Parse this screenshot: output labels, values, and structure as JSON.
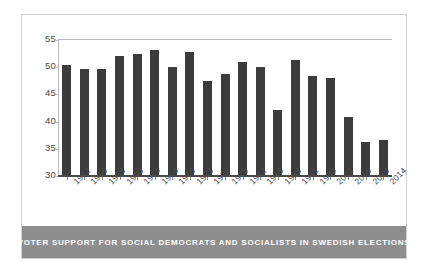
{
  "caption": "VOTER SUPPORT FOR SOCIAL DEMOCRATS AND SOCIALISTS IN SWEDISH ELECTIONS",
  "colors": {
    "bar": "#3c3c3c",
    "caption_bar": "#8e8e8e",
    "caption_text": "#ffffff",
    "axis": "#4a4a4a",
    "frame": "#d2d2d2",
    "background": "#ffffff"
  },
  "chart_data": {
    "type": "bar",
    "title": "VOTER SUPPORT FOR SOCIAL DEMOCRATS AND SOCIALISTS IN SWEDISH ELECTIONS",
    "xlabel": "",
    "ylabel": "",
    "ylim": [
      30,
      55
    ],
    "yticks": [
      30,
      35,
      40,
      45,
      50,
      55
    ],
    "grid": false,
    "legend": false,
    "categories": [
      "1952",
      "1956",
      "1958",
      "1960",
      "1964",
      "1968",
      "1970",
      "1973",
      "1976",
      "1979",
      "1982",
      "1985",
      "1988",
      "1991",
      "1998",
      "2002",
      "2006",
      "2010",
      "2014"
    ],
    "values": [
      50.3,
      49.5,
      49.4,
      51.9,
      52.3,
      52.9,
      49.9,
      52.6,
      47.3,
      48.6,
      50.8,
      49.8,
      42.0,
      51.2,
      48.2,
      47.9,
      40.6,
      36.1,
      36.5
    ]
  }
}
